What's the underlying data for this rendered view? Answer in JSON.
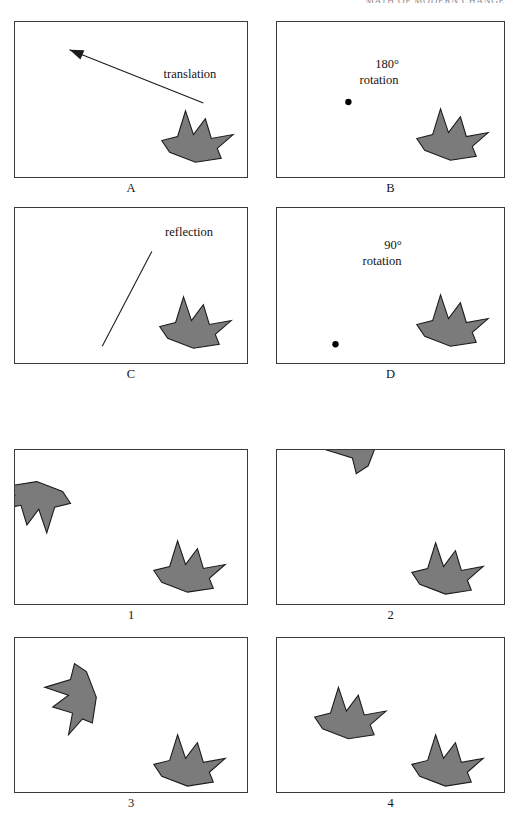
{
  "header": {
    "running_title": "MATH OF MODERN CHANGE"
  },
  "figure": {
    "shape_fill": "#7b7b7b",
    "shape_stroke": "#1c1c1c",
    "panel_border": "#3a3a3a",
    "base_shape_points": "30,2 38,26 50,10 56,30 78,26 62,40 66,50 40,54 14,44 6,32 22,28",
    "top_section": {
      "panels": [
        {
          "id": "A",
          "caption": "A",
          "annotation": "translation",
          "annotation_lines": [
            "translation"
          ],
          "marker": "arrow"
        },
        {
          "id": "B",
          "caption": "B",
          "annotation": "180° rotation",
          "annotation_lines": [
            "180°",
            "rotation"
          ],
          "marker": "dot"
        },
        {
          "id": "C",
          "caption": "C",
          "annotation": "reflection",
          "annotation_lines": [
            "reflection"
          ],
          "marker": "mirror-line"
        },
        {
          "id": "D",
          "caption": "D",
          "annotation": "90° rotation",
          "annotation_lines": [
            "90°",
            "rotation"
          ],
          "marker": "dot"
        }
      ]
    },
    "bottom_section": {
      "panels": [
        {
          "id": "1",
          "caption": "1",
          "image_transform": "rotate-180"
        },
        {
          "id": "2",
          "caption": "2",
          "image_transform": "rotate-90-ccw"
        },
        {
          "id": "3",
          "caption": "3",
          "image_transform": "reflect"
        },
        {
          "id": "4",
          "caption": "4",
          "image_transform": "translate"
        }
      ]
    }
  }
}
